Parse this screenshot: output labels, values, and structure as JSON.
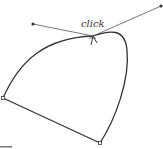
{
  "diagram": {
    "type": "bezier-path-illustration",
    "annotation": "click",
    "colors": {
      "stroke": "#333333",
      "handle": "#555555",
      "anchor_fill": "#ffffff",
      "text": "#333333"
    },
    "anchors": [
      {
        "name": "left",
        "x": 3,
        "y": 98
      },
      {
        "name": "bottom",
        "x": 100,
        "y": 143
      },
      {
        "name": "top-click",
        "x": 93,
        "y": 36
      }
    ],
    "handles": [
      {
        "name": "left-handle",
        "x": 33,
        "y": 24
      },
      {
        "name": "right-handle",
        "x": 161,
        "y": 6
      }
    ]
  }
}
